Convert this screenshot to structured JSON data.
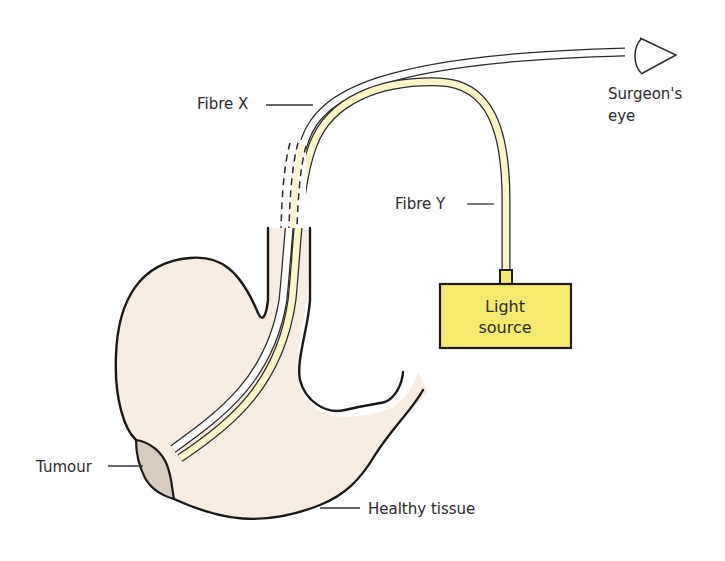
{
  "diagram": {
    "labels": {
      "fibre_x": "Fibre X",
      "fibre_y": "Fibre Y",
      "surgeons_eye_line1": "Surgeon's",
      "surgeons_eye_line2": "eye",
      "light_source_line1": "Light",
      "light_source_line2": "source",
      "tumour": "Tumour",
      "healthy_tissue": "Healthy tissue"
    },
    "colors": {
      "stomach_fill": "#f7ede2",
      "tumour_fill": "#d8ccbf",
      "fibre_y_fill": "#faf6c8",
      "fibre_x_fill": "#ffffff",
      "light_source_fill": "#f5ea6e",
      "outline": "#1a1a1a"
    }
  }
}
